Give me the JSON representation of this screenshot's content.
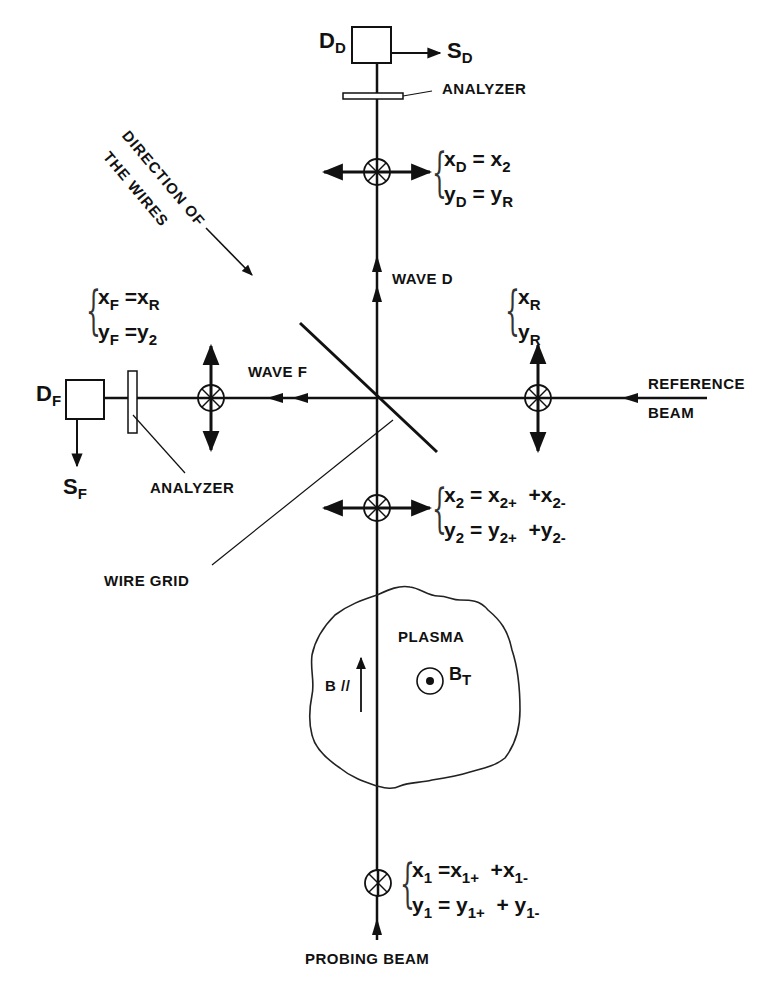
{
  "figure": {
    "labels": {
      "analyzer_top": "ANALYZER",
      "analyzer_left": "ANALYZER",
      "wave_d": "WAVE D",
      "wave_f": "WAVE F",
      "reference_beam_line1": "REFERENCE",
      "reference_beam_line2": "BEAM",
      "wire_grid": "WIRE GRID",
      "plasma": "PLASMA",
      "probing_beam": "PROBING BEAM",
      "direction_line1": "DIRECTION OF",
      "direction_line2": "THE WIRES"
    },
    "symbols": {
      "detector_d": {
        "main": "D",
        "sub": "D"
      },
      "signal_d": {
        "main": "S",
        "sub": "D"
      },
      "detector_f": {
        "main": "D",
        "sub": "F"
      },
      "signal_f": {
        "main": "S",
        "sub": "F"
      },
      "b_parallel": "B //",
      "b_toroidal": {
        "main": "B",
        "sub": "T"
      }
    },
    "equations": {
      "detector_d": {
        "x": {
          "lhs": "x",
          "lhs_sub": "D",
          "rhs": "x",
          "rhs_sub": "2"
        },
        "y": {
          "lhs": "y",
          "lhs_sub": "D",
          "rhs": "y",
          "rhs_sub": "R"
        }
      },
      "detector_f": {
        "x": {
          "lhs": "x",
          "lhs_sub": "F",
          "rhs": "x",
          "rhs_sub": "R"
        },
        "y": {
          "lhs": "y",
          "lhs_sub": "F",
          "rhs": "y",
          "rhs_sub": "2"
        }
      },
      "reference": {
        "x": {
          "lhs": "x",
          "lhs_sub": "R"
        },
        "y": {
          "lhs": "y",
          "lhs_sub": "R"
        }
      },
      "wave_2": {
        "x": {
          "lhs": "x",
          "lhs_sub": "2",
          "t1": "x",
          "t1_sub": "2+",
          "t2": "x",
          "t2_sub": "2-"
        },
        "y": {
          "lhs": "y",
          "lhs_sub": "2",
          "t1": "y",
          "t1_sub": "2+",
          "t2": "y",
          "t2_sub": "2-"
        }
      },
      "wave_1": {
        "x": {
          "lhs": "x",
          "lhs_sub": "1",
          "t1": "x",
          "t1_sub": "1+",
          "t2": "x",
          "t2_sub": "1-"
        },
        "y": {
          "lhs": "y",
          "lhs_sub": "1",
          "t1": "y",
          "t1_sub": "1+",
          "t2": "y",
          "t2_sub": "1-"
        }
      },
      "eq_sign": "=",
      "plus_sign": "+"
    },
    "colors": {
      "ink": "#111111",
      "background": "#ffffff"
    }
  }
}
